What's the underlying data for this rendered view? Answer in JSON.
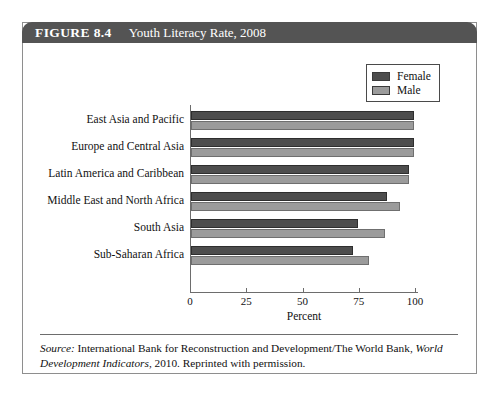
{
  "figure": {
    "number_label": "FIGURE 8.4",
    "title": "Youth Literacy Rate, 2008"
  },
  "source": {
    "label": "Source:",
    "text_part1": " International Bank for Reconstruction and Development/The World Bank, ",
    "italic_part": "World Development Indicators",
    "text_part2": ", 2010. Reprinted with permission."
  },
  "legend": {
    "entries": [
      {
        "label": "Female",
        "color": "#4d4d4d"
      },
      {
        "label": "Male",
        "color": "#9b9b9b"
      }
    ]
  },
  "axis": {
    "x_title": "Percent",
    "x_ticks": [
      "0",
      "25",
      "50",
      "75",
      "100"
    ]
  },
  "chart_data": {
    "type": "bar",
    "orientation": "horizontal",
    "title": "Youth Literacy Rate, 2008",
    "xlabel": "Percent",
    "ylabel": "",
    "xlim": [
      0,
      100
    ],
    "grid": false,
    "legend_position": "top-right",
    "categories": [
      "East Asia and Pacific",
      "Europe and Central Asia",
      "Latin America and Caribbean",
      "Middle East and North Africa",
      "South Asia",
      "Sub-Saharan Africa"
    ],
    "series": [
      {
        "name": "Female",
        "color": "#4d4d4d",
        "values": [
          99,
          99,
          97,
          87,
          74,
          72
        ]
      },
      {
        "name": "Male",
        "color": "#9b9b9b",
        "values": [
          99,
          99,
          97,
          93,
          86,
          79
        ]
      }
    ]
  }
}
